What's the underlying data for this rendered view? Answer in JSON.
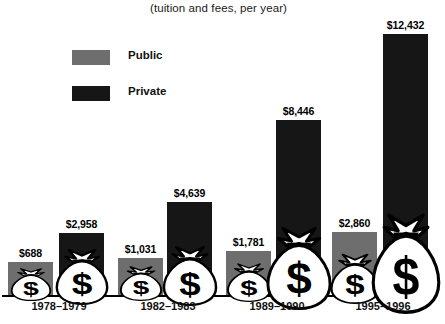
{
  "subtitle": "(tuition and fees, per year)",
  "legend": {
    "position": "top-left",
    "items": [
      {
        "label": "Public",
        "color": "#6e6e6e",
        "key": "public"
      },
      {
        "label": "Private",
        "color": "#161616",
        "key": "private"
      }
    ]
  },
  "icon": {
    "name": "money-bag-icon",
    "glyph": "$"
  },
  "chart_data": {
    "type": "bar",
    "title": "",
    "subtitle": "(tuition and fees, per year)",
    "xlabel": "",
    "ylabel": "",
    "grid": false,
    "legend_position": "top-left",
    "axis_visible": {
      "x": true,
      "y": false
    },
    "ylim": [
      0,
      12432
    ],
    "categories": [
      "1978–1979",
      "1982–1983",
      "1989–1990",
      "1995–1996"
    ],
    "series": [
      {
        "name": "Public",
        "color": "#6e6e6e",
        "values": [
          688,
          1031,
          1781,
          2860
        ],
        "labels": [
          "$688",
          "$1,031",
          "$1,781",
          "$2,860"
        ]
      },
      {
        "name": "Private",
        "color": "#161616",
        "values": [
          2958,
          4639,
          8446,
          12432
        ],
        "labels": [
          "$2,958",
          "$4,639",
          "$8,446",
          "$12,432"
        ]
      }
    ]
  },
  "bars": [
    {
      "name": "bar-public-1978-1979",
      "series": "Public",
      "category": "1978–1979",
      "label": "$688",
      "left": 8,
      "width": 45,
      "height": 33,
      "cls": "public"
    },
    {
      "name": "bar-private-1978-1979",
      "series": "Private",
      "category": "1978–1979",
      "label": "$2,958",
      "left": 59,
      "width": 45,
      "height": 62,
      "cls": "private"
    },
    {
      "name": "bar-public-1982-1983",
      "series": "Public",
      "category": "1982–1983",
      "label": "$1,031",
      "left": 118,
      "width": 45,
      "height": 37,
      "cls": "public"
    },
    {
      "name": "bar-private-1982-1983",
      "series": "Private",
      "category": "1982–1983",
      "label": "$4,639",
      "left": 167,
      "width": 45,
      "height": 93,
      "cls": "private"
    },
    {
      "name": "bar-public-1989-1990",
      "series": "Public",
      "category": "1989–1990",
      "label": "$1,781",
      "left": 226,
      "width": 45,
      "height": 44,
      "cls": "public"
    },
    {
      "name": "bar-private-1989-1990",
      "series": "Private",
      "category": "1989–1990",
      "label": "$8,446",
      "left": 276,
      "width": 45,
      "height": 175,
      "cls": "private"
    },
    {
      "name": "bar-public-1995-1996",
      "series": "Public",
      "category": "1995–1996",
      "label": "$2,860",
      "left": 332,
      "width": 45,
      "height": 63,
      "cls": "public"
    },
    {
      "name": "bar-private-1995-1996",
      "series": "Private",
      "category": "1995–1996",
      "label": "$12,432",
      "left": 383,
      "width": 45,
      "height": 261,
      "cls": "private"
    }
  ],
  "category_labels": [
    {
      "text": "1978–1979",
      "center": 59
    },
    {
      "text": "1982–1983",
      "center": 168
    },
    {
      "text": "1989–1990",
      "center": 277
    },
    {
      "text": "1995–1996",
      "center": 383
    }
  ],
  "bag_sizes": [
    {
      "w": 46,
      "h": 34
    },
    {
      "w": 60,
      "h": 58
    },
    {
      "w": 48,
      "h": 36
    },
    {
      "w": 62,
      "h": 62
    },
    {
      "w": 50,
      "h": 40
    },
    {
      "w": 74,
      "h": 86
    },
    {
      "w": 56,
      "h": 52
    },
    {
      "w": 78,
      "h": 104
    }
  ]
}
